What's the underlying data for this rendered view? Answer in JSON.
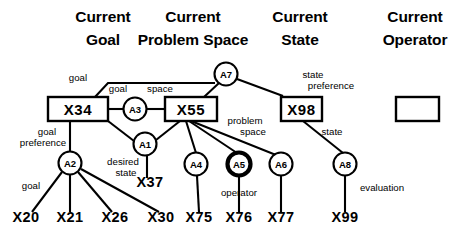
{
  "diagram": {
    "columns": [
      {
        "id": "current-goal",
        "line1": "Current",
        "line2": "Goal",
        "x": 103,
        "y1": 22,
        "y2": 45
      },
      {
        "id": "current-problem-space",
        "line1": "Current",
        "line2": "Problem Space",
        "x": 193,
        "y1": 22,
        "y2": 45
      },
      {
        "id": "current-state",
        "line1": "Current",
        "line2": "State",
        "x": 300,
        "y1": 22,
        "y2": 45
      },
      {
        "id": "current-operator",
        "line1": "Current",
        "line2": "Operator",
        "x": 415,
        "y1": 22,
        "y2": 45
      }
    ],
    "boxes": [
      {
        "id": "X34",
        "label": "X34",
        "x": 48,
        "y": 97,
        "w": 60,
        "h": 24
      },
      {
        "id": "X55",
        "label": "X55",
        "x": 165,
        "y": 97,
        "w": 52,
        "h": 24
      },
      {
        "id": "X98",
        "label": "X98",
        "x": 281,
        "y": 97,
        "w": 41,
        "h": 24
      },
      {
        "id": "OP",
        "label": "",
        "x": 396,
        "y": 97,
        "w": 43,
        "h": 24
      }
    ],
    "circles": [
      {
        "id": "A7",
        "label": "A7",
        "cx": 226,
        "cy": 74,
        "r": 11.5,
        "bold": false
      },
      {
        "id": "A3",
        "label": "A3",
        "cx": 135,
        "cy": 109,
        "r": 11.5,
        "bold": false
      },
      {
        "id": "A1",
        "label": "A1",
        "cx": 145,
        "cy": 144,
        "r": 11.5,
        "bold": false
      },
      {
        "id": "A2",
        "label": "A2",
        "cx": 70,
        "cy": 163,
        "r": 11.5,
        "bold": false
      },
      {
        "id": "A4",
        "label": "A4",
        "cx": 196,
        "cy": 164,
        "r": 11.5,
        "bold": false
      },
      {
        "id": "A5",
        "label": "A5",
        "cx": 239,
        "cy": 164,
        "r": 11.5,
        "bold": true
      },
      {
        "id": "A6",
        "label": "A6",
        "cx": 281,
        "cy": 164,
        "r": 11.5,
        "bold": false
      },
      {
        "id": "A8",
        "label": "A8",
        "cx": 345,
        "cy": 164,
        "r": 11.5,
        "bold": false
      }
    ],
    "leaves": [
      {
        "id": "X20",
        "label": "X20",
        "x": 26,
        "y": 222
      },
      {
        "id": "X21",
        "label": "X21",
        "x": 70,
        "y": 222
      },
      {
        "id": "X26",
        "label": "X26",
        "x": 115,
        "y": 222
      },
      {
        "id": "X30",
        "label": "X30",
        "x": 161,
        "y": 222
      },
      {
        "id": "X37",
        "label": "X37",
        "x": 150,
        "y": 187
      },
      {
        "id": "X75",
        "label": "X75",
        "x": 199,
        "y": 222
      },
      {
        "id": "X76",
        "label": "X76",
        "x": 239,
        "y": 222
      },
      {
        "id": "X77",
        "label": "X77",
        "x": 281,
        "y": 222
      },
      {
        "id": "X99",
        "label": "X99",
        "x": 345,
        "y": 222
      }
    ],
    "edges": [
      {
        "id": "X34-top-to-A7",
        "from": "X34",
        "to": "A7",
        "path": "M 95 97 L 108 83 L 215 83"
      },
      {
        "id": "X34-to-A3",
        "from": "X34",
        "to": "A3",
        "path": "M 108 109 L 124 109"
      },
      {
        "id": "A3-to-X55",
        "from": "A3",
        "to": "X55",
        "path": "M 147 109 L 165 109"
      },
      {
        "id": "X55-to-A7",
        "from": "X55",
        "to": "A7",
        "path": "M 204 97 L 219 83"
      },
      {
        "id": "A7-to-X98",
        "from": "A7",
        "to": "X98",
        "path": "M 237 79 L 283 96"
      },
      {
        "id": "X34-to-A1",
        "from": "X34",
        "to": "A1",
        "path": "M 108 121 L 134 141"
      },
      {
        "id": "A1-to-X55",
        "from": "A1",
        "to": "X55",
        "path": "M 156 140 L 180 121"
      },
      {
        "id": "X34-to-A2",
        "from": "X34",
        "to": "A2",
        "path": "M 70 121 L 70 151"
      },
      {
        "id": "A2-to-X20",
        "from": "A2",
        "to": "X20",
        "path": "M 62 172 L 32 212"
      },
      {
        "id": "A2-to-X21",
        "from": "A2",
        "to": "X21",
        "path": "M 70 175 L 70 212"
      },
      {
        "id": "A2-to-X26",
        "from": "A2",
        "to": "X26",
        "path": "M 78 172 L 112 212"
      },
      {
        "id": "A2-to-X30",
        "from": "A2",
        "to": "X30",
        "path": "M 81 169 L 159 212"
      },
      {
        "id": "A1-to-X37",
        "from": "A1",
        "to": "X37",
        "path": "M 147 156 L 147 178"
      },
      {
        "id": "X55-to-A4",
        "from": "X55",
        "to": "A4",
        "path": "M 186 121 L 196 153"
      },
      {
        "id": "X55-to-A5",
        "from": "X55",
        "to": "A5",
        "path": "M 189 121 L 237 153"
      },
      {
        "id": "X55-to-A6",
        "from": "X55",
        "to": "A6",
        "path": "M 191 121 L 276 155"
      },
      {
        "id": "A4-to-X75",
        "from": "A4",
        "to": "X75",
        "path": "M 197 176 L 199 212"
      },
      {
        "id": "A5-to-X76",
        "from": "A5",
        "to": "X76",
        "path": "M 239 177 L 239 212"
      },
      {
        "id": "A6-to-X77",
        "from": "A6",
        "to": "X77",
        "path": "M 281 176 L 281 212"
      },
      {
        "id": "X98-to-A8",
        "from": "X98",
        "to": "A8",
        "path": "M 303 121 L 343 153"
      },
      {
        "id": "A8-to-X99",
        "from": "A8",
        "to": "X99",
        "path": "M 345 176 L 345 212"
      }
    ],
    "edge_labels": [
      {
        "id": "label-goal-top",
        "text": "goal",
        "x": 78,
        "y": 81
      },
      {
        "id": "label-goal-a3",
        "text": "goal",
        "x": 118,
        "y": 92
      },
      {
        "id": "label-space",
        "text": "space",
        "x": 160,
        "y": 92
      },
      {
        "id": "label-state-pref-1",
        "text": "state",
        "x": 313,
        "y": 78
      },
      {
        "id": "label-state-pref-2",
        "text": "preference",
        "x": 331,
        "y": 89
      },
      {
        "id": "label-goal-pref-1",
        "text": "goal",
        "x": 47,
        "y": 135
      },
      {
        "id": "label-goal-pref-2",
        "text": "preference",
        "x": 43,
        "y": 146
      },
      {
        "id": "label-problem-space-1",
        "text": "problem",
        "x": 245,
        "y": 124
      },
      {
        "id": "label-problem-space-2",
        "text": "space",
        "x": 253,
        "y": 135
      },
      {
        "id": "label-state",
        "text": "state",
        "x": 332,
        "y": 135
      },
      {
        "id": "label-desired-1",
        "text": "desired",
        "x": 123,
        "y": 165
      },
      {
        "id": "label-desired-2",
        "text": "state",
        "x": 126,
        "y": 176
      },
      {
        "id": "label-goal-a2",
        "text": "goal",
        "x": 31,
        "y": 189
      },
      {
        "id": "label-operator",
        "text": "operator",
        "x": 239,
        "y": 196
      },
      {
        "id": "label-evaluation",
        "text": "evaluation",
        "x": 382,
        "y": 191
      }
    ],
    "colors": {
      "ink": "#000000",
      "paper": "#ffffff"
    }
  }
}
